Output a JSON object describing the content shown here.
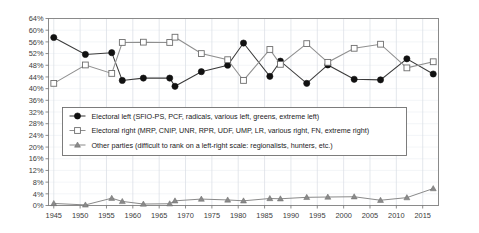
{
  "chart_data": {
    "type": "line",
    "title": "",
    "subtitle": "",
    "xlabel": "",
    "ylabel": "",
    "xlim": [
      1944,
      2018
    ],
    "ylim": [
      0,
      64
    ],
    "grid": "vertical major, horizontal light",
    "legend_position": "inside center-left",
    "ytick_labels": [
      "0%",
      "4%",
      "8%",
      "12%",
      "16%",
      "20%",
      "24%",
      "28%",
      "32%",
      "36%",
      "40%",
      "44%",
      "48%",
      "52%",
      "56%",
      "60%",
      "64%"
    ],
    "ytick_values": [
      0,
      4,
      8,
      12,
      16,
      20,
      24,
      28,
      32,
      36,
      40,
      44,
      48,
      52,
      56,
      60,
      64
    ],
    "xtick_labels": [
      "1945",
      "1950",
      "1955",
      "1960",
      "1965",
      "1970",
      "1975",
      "1980",
      "1985",
      "1990",
      "1995",
      "2000",
      "2005",
      "2010",
      "2015"
    ],
    "xtick_values": [
      1945,
      1950,
      1955,
      1960,
      1965,
      1970,
      1975,
      1980,
      1985,
      1990,
      1995,
      2000,
      2005,
      2010,
      2015
    ],
    "x": [
      1945,
      1951,
      1956,
      1958,
      1962,
      1967,
      1968,
      1973,
      1978,
      1981,
      1986,
      1988,
      1993,
      1997,
      2002,
      2007,
      2012,
      2017
    ],
    "series": [
      {
        "name": "Electoral left (SFIO-PS, PCF, radicals, various left, greens, extreme left)",
        "marker": "filled-circle",
        "color": "#111111",
        "values": [
          57.5,
          51.7,
          52.3,
          42.8,
          43.6,
          43.6,
          40.8,
          45.8,
          48.0,
          55.6,
          44.2,
          49.4,
          41.8,
          48.1,
          43.2,
          43.0,
          50.2,
          45.0
        ]
      },
      {
        "name": "Electoral right (MRP, CNIP, UNR, RPR, UDF, UMP, LR, various right, FN, extreme right)",
        "marker": "open-square",
        "color": "#8f8f8f",
        "values": [
          41.8,
          48.1,
          45.2,
          55.8,
          55.9,
          55.8,
          57.6,
          52.0,
          49.9,
          42.8,
          53.4,
          48.3,
          55.4,
          49.0,
          53.8,
          55.2,
          47.1,
          49.2
        ]
      },
      {
        "name": "Other parties (difficult to rank on a left-right scale: regionalists, hunters, etc.)",
        "marker": "filled-triangle",
        "color": "#8a8a8a",
        "values": [
          0.7,
          0.2,
          2.5,
          1.4,
          0.5,
          0.6,
          1.6,
          2.2,
          1.9,
          1.6,
          2.4,
          2.3,
          2.8,
          2.9,
          3.0,
          1.8,
          2.7,
          5.8
        ]
      }
    ]
  },
  "legend": {
    "items": [
      {
        "label": "Electoral left (SFIO-PS, PCF, radicals, various left, greens, extreme left)",
        "marker": "filled-circle"
      },
      {
        "label": "Electoral right (MRP, CNIP, UNR, RPR, UDF, UMP, LR, various right, FN, extreme right)",
        "marker": "open-square"
      },
      {
        "label": "Other parties (difficult to rank on a left-right scale: regionalists, hunters, etc.)",
        "marker": "filled-triangle"
      }
    ]
  }
}
